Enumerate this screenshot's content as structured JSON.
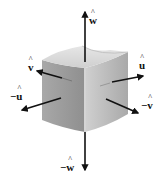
{
  "figure": {
    "labels": {
      "w_pos": {
        "sign": "",
        "symbol": "w",
        "text": "ŵ"
      },
      "w_neg": {
        "sign": "−",
        "symbol": "w",
        "text": "−ŵ"
      },
      "u_pos": {
        "sign": "",
        "symbol": "u",
        "text": "û"
      },
      "u_neg": {
        "sign": "−",
        "symbol": "u",
        "text": "−û"
      },
      "v_pos": {
        "sign": "",
        "symbol": "v",
        "text": "v̂"
      },
      "v_neg": {
        "sign": "−",
        "symbol": "v",
        "text": "−v̂"
      }
    },
    "colors": {
      "arrow": "#111111",
      "block_top": "#dcdcdc",
      "block_left": "#9a9a9a",
      "block_right": "#b9b9b9",
      "block_edge_highlight": "#cfcfcf"
    }
  }
}
